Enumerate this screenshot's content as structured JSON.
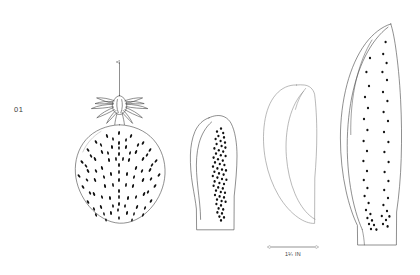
{
  "plate": {
    "label": "01",
    "background_color": "#ffffff",
    "ink_color": "#4a4a4a",
    "seed_color": "#111111",
    "width": 420,
    "height": 275
  },
  "scale_bar": {
    "caption": "1¼ IN",
    "x_start": 270,
    "x_end": 316,
    "y": 247
  },
  "figures": [
    {
      "name": "whole-berry-with-calyx",
      "parts": [
        "stem-arrow",
        "calyx",
        "berry-body",
        "achenes"
      ],
      "achene_count": 86
    },
    {
      "name": "half-section-narrow-slice",
      "parts": [
        "outline",
        "inner-contour",
        "achene-band"
      ],
      "achene_count": 58
    },
    {
      "name": "plain-slice",
      "parts": [
        "outline",
        "inner-contour"
      ],
      "achene_count": 0
    },
    {
      "name": "tall-elongated-slice",
      "parts": [
        "outline",
        "inner-contour",
        "achene-columns"
      ],
      "achene_count": 46
    }
  ]
}
